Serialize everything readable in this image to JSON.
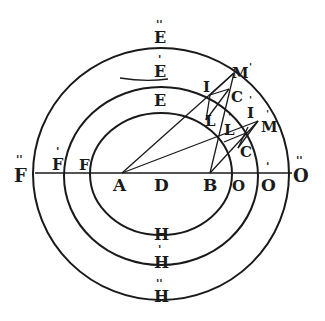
{
  "diagram": {
    "axis_labels": [
      {
        "id": "F2",
        "text": "F",
        "prime": "''",
        "x": 18,
        "y": 179
      },
      {
        "id": "F1",
        "text": "F",
        "prime": "'",
        "x": 56,
        "y": 170
      },
      {
        "id": "F0",
        "text": "F",
        "prime": "",
        "x": 83,
        "y": 170
      },
      {
        "id": "A",
        "text": "A",
        "prime": "",
        "x": 115,
        "y": 195
      },
      {
        "id": "D",
        "text": "D",
        "prime": "",
        "x": 155,
        "y": 195
      },
      {
        "id": "B",
        "text": "B",
        "prime": "",
        "x": 203,
        "y": 195
      },
      {
        "id": "O0",
        "text": "O",
        "prime": "",
        "x": 231,
        "y": 195
      },
      {
        "id": "O1",
        "text": "O",
        "prime": "'",
        "x": 262,
        "y": 195
      },
      {
        "id": "O2",
        "text": "O",
        "prime": "''",
        "x": 293,
        "y": 192
      }
    ],
    "top_labels": [
      {
        "id": "E2",
        "text": "E",
        "prime": "''",
        "x": 154,
        "y": 42
      },
      {
        "id": "E1",
        "text": "E",
        "prime": "'",
        "x": 154,
        "y": 79
      },
      {
        "id": "E0",
        "text": "E",
        "prime": "",
        "x": 154,
        "y": 107
      }
    ],
    "bottom_labels": [
      {
        "id": "H0",
        "text": "H",
        "prime": "",
        "x": 154,
        "y": 249
      },
      {
        "id": "H1",
        "text": "H",
        "prime": "'",
        "x": 154,
        "y": 273
      },
      {
        "id": "H2",
        "text": "H",
        "prime": "''",
        "x": 154,
        "y": 307
      }
    ],
    "construction_labels": [
      {
        "id": "M1",
        "text": "M",
        "prime": "'",
        "x": 234,
        "y": 79
      },
      {
        "id": "I0",
        "text": "I",
        "prime": "",
        "x": 204,
        "y": 91
      },
      {
        "id": "C0",
        "text": "C",
        "prime": "",
        "x": 231,
        "y": 102
      },
      {
        "id": "L0",
        "text": "L",
        "prime": "",
        "x": 205,
        "y": 125
      },
      {
        "id": "L1",
        "text": "L",
        "prime": "'",
        "x": 224,
        "y": 134
      },
      {
        "id": "I1",
        "text": "I",
        "prime": "'",
        "x": 246,
        "y": 121
      },
      {
        "id": "M0",
        "text": "M",
        "prime": "'",
        "x": 262,
        "y": 131
      },
      {
        "id": "C1",
        "text": "C",
        "prime": "",
        "x": 240,
        "y": 158
      }
    ],
    "ellipses": [
      {
        "name": "outer",
        "cx": 161,
        "cy": 174,
        "rx": 128,
        "ry": 126
      },
      {
        "name": "middle",
        "cx": 161,
        "cy": 176,
        "rx": 97,
        "ry": 89
      },
      {
        "name": "inner",
        "cx": 161,
        "cy": 174,
        "rx": 71,
        "ry": 61
      }
    ],
    "ink_color": "#1a1a1a",
    "paper_color": "#ffffff"
  }
}
